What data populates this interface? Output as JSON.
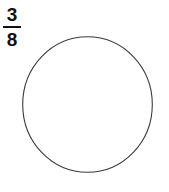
{
  "figure": {
    "kind": "fraction-circle-model",
    "background_color": "#ffffff",
    "label": {
      "text": "3/8",
      "numerator": "3",
      "denominator": "8",
      "color": "#111111"
    },
    "shape": {
      "name": "circle",
      "filled": false,
      "fill_color": "#ffffff",
      "stroke_color": "#3a3a3a",
      "stroke_width": 1,
      "divisions": 0,
      "shaded_parts": 0,
      "center_x": 65.5,
      "center_y": 68.5,
      "radius_x": 65,
      "radius_y": 68
    }
  }
}
